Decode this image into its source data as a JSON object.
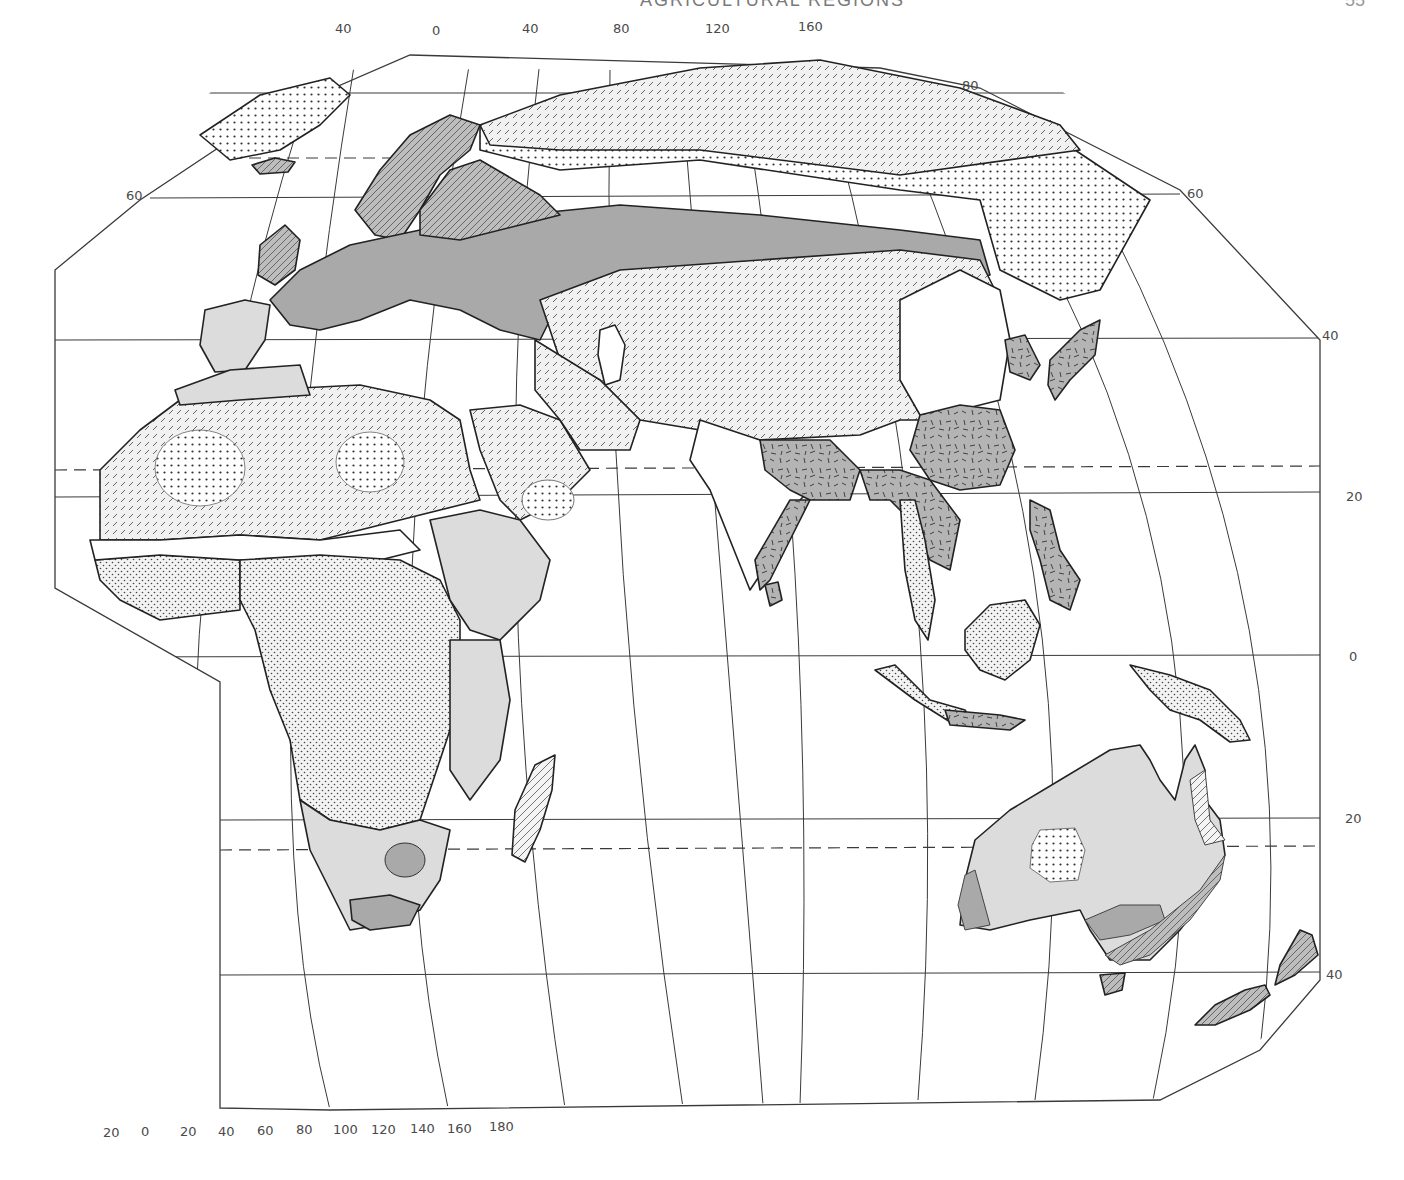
{
  "page": {
    "header_title": "AGRICULTURAL REGIONS",
    "page_number": "55"
  },
  "map": {
    "type": "thematic-map",
    "subject": "Agricultural regions of the Eastern Hemisphere",
    "projection_frame": "clipped elliptical graticule",
    "top_longitude_labels": [
      "40",
      "0",
      "40",
      "80",
      "120",
      "160"
    ],
    "bottom_longitude_labels": [
      "20",
      "0",
      "20",
      "40",
      "60",
      "80",
      "100",
      "120",
      "140",
      "160",
      "180"
    ],
    "left_latitude_labels": [
      "60"
    ],
    "right_latitude_labels": [
      "80",
      "60",
      "40",
      "20",
      "0",
      "20",
      "40"
    ],
    "tropic_lines": [
      "Tropic of Cancer",
      "Tropic of Capricorn"
    ],
    "legend_patterns": [
      {
        "id": "dense-dots",
        "description": "Dense dot grid (nonagricultural / tundra & desert cores)"
      },
      {
        "id": "fine-dash",
        "description": "Fine diagonal dashes (nomadic herding)"
      },
      {
        "id": "hatch-gray",
        "description": "Gray with diagonal hatching (dairy / forestry)"
      },
      {
        "id": "solid-gray",
        "description": "Medium gray (commercial grain / mixed farming)"
      },
      {
        "id": "light-gray",
        "description": "Light gray (livestock ranching / subsistence)"
      },
      {
        "id": "random-dash-gray",
        "description": "Gray with random dashes (intensive subsistence, rice dominant)"
      },
      {
        "id": "stipple",
        "description": "Stippled dots (shifting cultivation)"
      },
      {
        "id": "white",
        "description": "White (Mediterranean / other / unclassified)"
      }
    ],
    "colors": {
      "ink": "#222222",
      "gray_medium": "#a9a9a9",
      "gray_light": "#dcdcdc",
      "gray_dark_fill": "#b8b8b8",
      "paper": "#ffffff"
    }
  }
}
